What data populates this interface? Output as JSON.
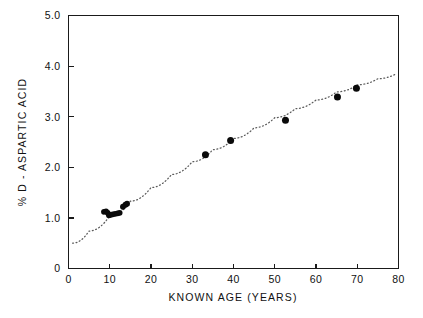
{
  "chart_data": {
    "type": "scatter",
    "title": "",
    "subtitle": "",
    "xlabel": "KNOWN AGE (YEARS)",
    "ylabel": "% D - ASPARTIC ACID",
    "xlim": [
      0,
      80
    ],
    "ylim": [
      0,
      5.0
    ],
    "xticks": [
      0,
      10,
      20,
      30,
      40,
      50,
      60,
      70,
      80
    ],
    "xtick_labels": [
      "0",
      "10",
      "20",
      "30",
      "40",
      "50",
      "60",
      "70",
      "80"
    ],
    "yticks": [
      0,
      1.0,
      2.0,
      3.0,
      4.0,
      5.0
    ],
    "ytick_labels": [
      "0",
      "1.0",
      "2.0",
      "3.0",
      "4.0",
      "5.0"
    ],
    "grid": false,
    "legend": null,
    "legend_position": "none",
    "marker": "filled-circle",
    "marker_color": "#0a0a0a",
    "series": [
      {
        "name": "samples",
        "points": [
          {
            "x": 8.6,
            "y": 1.12
          },
          {
            "x": 9.1,
            "y": 1.13
          },
          {
            "x": 9.5,
            "y": 1.1
          },
          {
            "x": 9.8,
            "y": 1.05
          },
          {
            "x": 10.2,
            "y": 1.06
          },
          {
            "x": 10.7,
            "y": 1.07
          },
          {
            "x": 11.3,
            "y": 1.08
          },
          {
            "x": 11.9,
            "y": 1.09
          },
          {
            "x": 12.4,
            "y": 1.1
          },
          {
            "x": 13.2,
            "y": 1.22
          },
          {
            "x": 13.8,
            "y": 1.26
          },
          {
            "x": 14.2,
            "y": 1.28
          },
          {
            "x": 33.2,
            "y": 2.25
          },
          {
            "x": 39.3,
            "y": 2.53
          },
          {
            "x": 52.6,
            "y": 2.93
          },
          {
            "x": 65.2,
            "y": 3.39
          },
          {
            "x": 69.8,
            "y": 3.56
          }
        ]
      }
    ],
    "fit_curve": {
      "name": "dotted trend line",
      "style": "dotted",
      "color": "#5b5b5b",
      "points": [
        {
          "x": 1.0,
          "y": 0.5
        },
        {
          "x": 5.0,
          "y": 0.74
        },
        {
          "x": 10.0,
          "y": 1.04
        },
        {
          "x": 15.0,
          "y": 1.33
        },
        {
          "x": 20.0,
          "y": 1.6
        },
        {
          "x": 25.0,
          "y": 1.86
        },
        {
          "x": 30.0,
          "y": 2.11
        },
        {
          "x": 35.0,
          "y": 2.35
        },
        {
          "x": 40.0,
          "y": 2.57
        },
        {
          "x": 45.0,
          "y": 2.78
        },
        {
          "x": 50.0,
          "y": 2.98
        },
        {
          "x": 55.0,
          "y": 3.16
        },
        {
          "x": 60.0,
          "y": 3.33
        },
        {
          "x": 65.0,
          "y": 3.49
        },
        {
          "x": 70.0,
          "y": 3.63
        },
        {
          "x": 75.0,
          "y": 3.75
        },
        {
          "x": 79.5,
          "y": 3.85
        }
      ]
    }
  },
  "axes": {
    "x_axis_title": "KNOWN AGE (YEARS)",
    "y_axis_title": "% D - ASPARTIC ACID"
  }
}
